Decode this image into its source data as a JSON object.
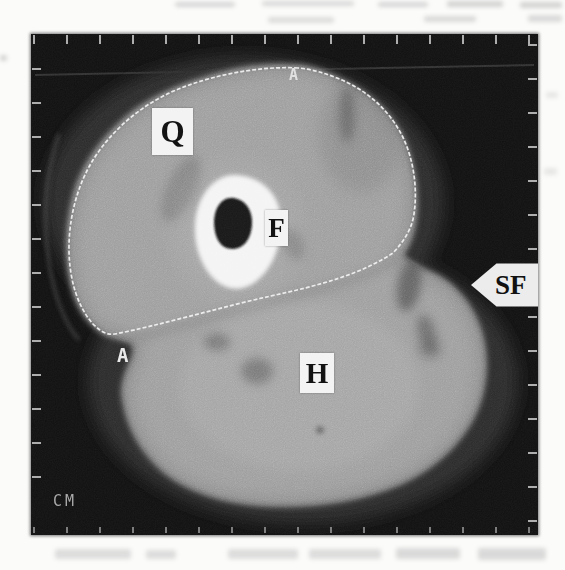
{
  "scan": {
    "unit_label": "CM",
    "labels": {
      "q": "Q",
      "f": "F",
      "h": "H"
    },
    "arrow": {
      "label": "SF",
      "direction": "left"
    },
    "trace": {
      "start_marker": "A",
      "end_marker": "A"
    }
  },
  "colors": {
    "page_background": "#fbfbfa",
    "frame_background": "#0f0f0f",
    "muscle": "#9c9c9c",
    "subcutaneous_fat": "#2a2a2a",
    "bone": "#f4f4f4",
    "marrow": "#131313",
    "trace_line": "#efefef",
    "label_box_bg": "#f3f3f3",
    "label_text": "#131313",
    "tick": "#c9c9c9"
  }
}
